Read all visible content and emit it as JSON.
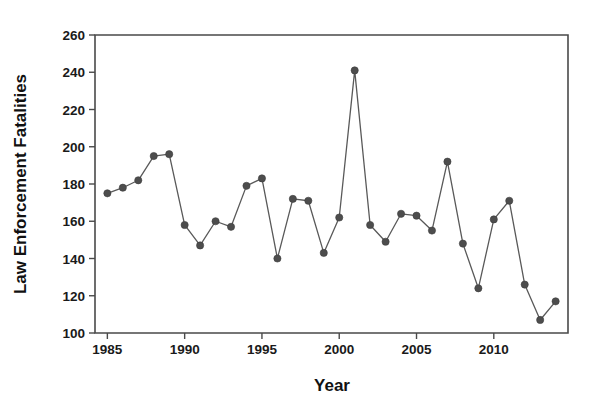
{
  "chart_data": {
    "type": "line",
    "title": "",
    "xlabel": "Year",
    "ylabel": "Law Enforcement Fatalities",
    "xlim": [
      1984.2,
      2014.8
    ],
    "ylim": [
      100,
      260
    ],
    "xticks": [
      1985,
      1990,
      1995,
      2000,
      2005,
      2010
    ],
    "xticklabels": [
      "1985",
      "1990",
      "1995",
      "2000",
      "2005",
      "2010"
    ],
    "yticks": [
      100,
      120,
      140,
      160,
      180,
      200,
      220,
      240,
      260
    ],
    "yticklabels": [
      "100",
      "120",
      "140",
      "160",
      "180",
      "200",
      "220",
      "240",
      "260"
    ],
    "grid": false,
    "legend": false,
    "marker": "circle",
    "line_color": "#595959",
    "marker_color": "#4d4d4d",
    "x": [
      1985,
      1986,
      1987,
      1988,
      1989,
      1990,
      1991,
      1992,
      1993,
      1994,
      1995,
      1996,
      1997,
      1998,
      1999,
      2000,
      2001,
      2002,
      2003,
      2004,
      2005,
      2006,
      2007,
      2008,
      2009,
      2010,
      2011,
      2012,
      2013,
      2014
    ],
    "values": [
      175,
      178,
      182,
      195,
      196,
      158,
      147,
      160,
      157,
      179,
      183,
      140,
      172,
      171,
      143,
      162,
      241,
      158,
      149,
      164,
      163,
      155,
      192,
      148,
      124,
      161,
      171,
      126,
      107,
      117
    ],
    "series": [
      {
        "name": "Law Enforcement Fatalities",
        "values": [
          175,
          178,
          182,
          195,
          196,
          158,
          147,
          160,
          157,
          179,
          183,
          140,
          172,
          171,
          143,
          162,
          241,
          158,
          149,
          164,
          163,
          155,
          192,
          148,
          124,
          161,
          171,
          126,
          107,
          117
        ]
      }
    ]
  }
}
